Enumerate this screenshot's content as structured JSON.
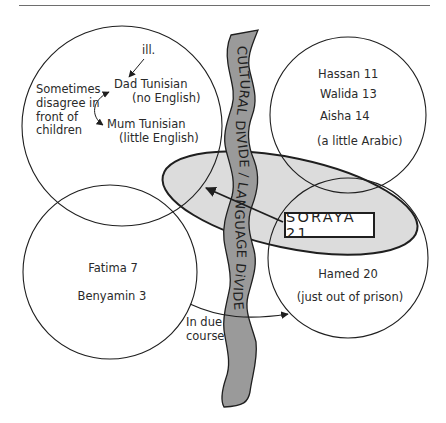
{
  "diagram": {
    "type": "family-relationship-ecomap",
    "colors": {
      "line": "#1f1f1f",
      "river_fill": "#9a9a9a",
      "ellipse_fill": "#dcdcdc",
      "background": "#ffffff"
    },
    "divide": {
      "top_text": "CULTURAL DIVIDE",
      "separator": "/",
      "bottom_text": "LANGUAGE DiVIDE"
    },
    "groups": {
      "parents": {
        "ill_note": "ill.",
        "dad": "Dad  Tunisian",
        "dad_note": "(no English)",
        "mum": "Mum Tunisian",
        "mum_note": "(little English)",
        "side_note_1": "Sometimes",
        "side_note_2": "disagree in",
        "side_note_3": "front of",
        "side_note_4": "children"
      },
      "siblings": {
        "line1": "Hassan  11",
        "line2": "Walida 13",
        "line3": "Aisha 14",
        "note": "(a little Arabic)"
      },
      "young_children": {
        "line1": "Fatima  7",
        "line2": "Benyamin  3"
      },
      "brother": {
        "line1": "Hamed 20",
        "note": "(just out of prison)"
      },
      "focus": {
        "label": "SORAYA 21"
      },
      "transition": {
        "line1": "In due",
        "line2": "course"
      }
    }
  }
}
